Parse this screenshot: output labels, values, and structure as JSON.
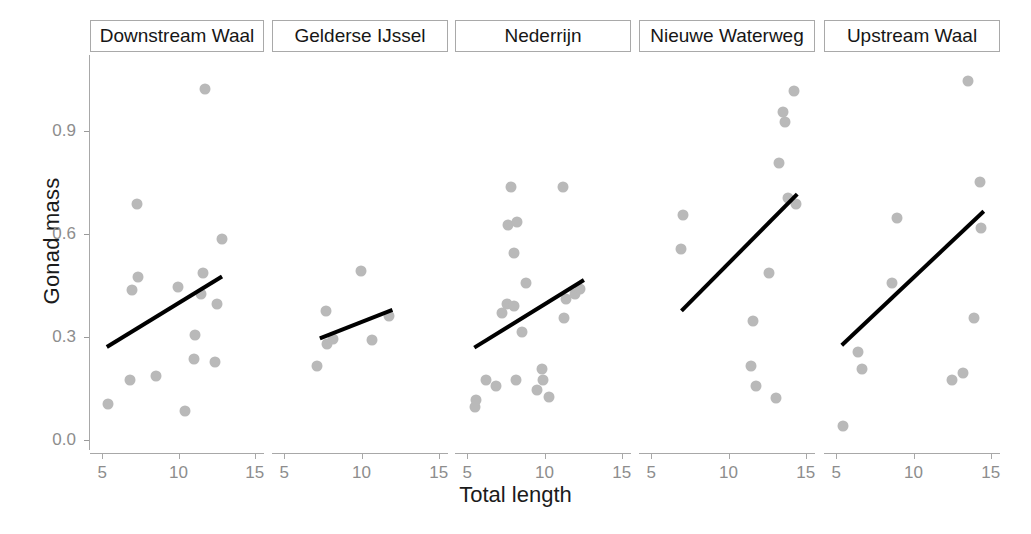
{
  "chart_data": {
    "type": "scatter",
    "title": "",
    "xlabel": "Total length",
    "ylabel": "Gonad mass",
    "xlim": [
      4.2,
      15.6
    ],
    "ylim": [
      -0.03,
      1.12
    ],
    "xticks": [
      5,
      10,
      15
    ],
    "yticks": [
      0.0,
      0.3,
      0.6,
      0.9
    ],
    "ytick_labels": [
      "0.0",
      "0.3",
      "0.6",
      "0.9"
    ],
    "xtick_labels": [
      "5",
      "10",
      "15"
    ],
    "grid": false,
    "legend": "none",
    "facet_layout": "1 row x 5 columns",
    "point_color": "#b9b9b9",
    "line_color": "#000000",
    "axis_color": "#a8a8a8",
    "tick_label_color": "#8d8d8d",
    "panels": [
      {
        "label": "Downstream Waal",
        "points": [
          {
            "x": 5.35,
            "y": 0.105
          },
          {
            "x": 6.8,
            "y": 0.175
          },
          {
            "x": 7.25,
            "y": 0.685
          },
          {
            "x": 6.95,
            "y": 0.435
          },
          {
            "x": 7.35,
            "y": 0.475
          },
          {
            "x": 8.5,
            "y": 0.185
          },
          {
            "x": 9.95,
            "y": 0.445
          },
          {
            "x": 10.4,
            "y": 0.085
          },
          {
            "x": 11.0,
            "y": 0.235
          },
          {
            "x": 11.1,
            "y": 0.305
          },
          {
            "x": 11.5,
            "y": 0.425
          },
          {
            "x": 11.6,
            "y": 0.485
          },
          {
            "x": 11.75,
            "y": 1.02
          },
          {
            "x": 12.4,
            "y": 0.225
          },
          {
            "x": 12.5,
            "y": 0.395
          },
          {
            "x": 12.85,
            "y": 0.585
          }
        ],
        "fit": {
          "x0": 5.3,
          "y0": 0.27,
          "x1": 12.85,
          "y1": 0.475
        }
      },
      {
        "label": "Gelderse IJssel",
        "points": [
          {
            "x": 7.1,
            "y": 0.215
          },
          {
            "x": 7.7,
            "y": 0.375
          },
          {
            "x": 7.75,
            "y": 0.278
          },
          {
            "x": 8.15,
            "y": 0.292
          },
          {
            "x": 9.95,
            "y": 0.49
          },
          {
            "x": 10.7,
            "y": 0.29
          },
          {
            "x": 11.75,
            "y": 0.36
          }
        ],
        "fit": {
          "x0": 7.3,
          "y0": 0.295,
          "x1": 12.0,
          "y1": 0.378
        }
      },
      {
        "label": "Nederrijn",
        "points": [
          {
            "x": 5.5,
            "y": 0.095
          },
          {
            "x": 5.55,
            "y": 0.115
          },
          {
            "x": 6.2,
            "y": 0.175
          },
          {
            "x": 6.85,
            "y": 0.155
          },
          {
            "x": 7.25,
            "y": 0.37
          },
          {
            "x": 7.6,
            "y": 0.395
          },
          {
            "x": 7.65,
            "y": 0.625
          },
          {
            "x": 7.8,
            "y": 0.735
          },
          {
            "x": 8.0,
            "y": 0.545
          },
          {
            "x": 8.05,
            "y": 0.39
          },
          {
            "x": 8.2,
            "y": 0.635
          },
          {
            "x": 8.15,
            "y": 0.175
          },
          {
            "x": 8.55,
            "y": 0.315
          },
          {
            "x": 8.8,
            "y": 0.455
          },
          {
            "x": 9.5,
            "y": 0.145
          },
          {
            "x": 9.85,
            "y": 0.205
          },
          {
            "x": 9.9,
            "y": 0.175
          },
          {
            "x": 10.3,
            "y": 0.125
          },
          {
            "x": 11.2,
            "y": 0.735
          },
          {
            "x": 11.25,
            "y": 0.355
          },
          {
            "x": 11.4,
            "y": 0.41
          },
          {
            "x": 12.0,
            "y": 0.425
          },
          {
            "x": 12.3,
            "y": 0.44
          }
        ],
        "fit": {
          "x0": 5.45,
          "y0": 0.268,
          "x1": 12.55,
          "y1": 0.465
        }
      },
      {
        "label": "Nieuwe Waterweg",
        "points": [
          {
            "x": 7.05,
            "y": 0.655
          },
          {
            "x": 6.9,
            "y": 0.555
          },
          {
            "x": 11.45,
            "y": 0.215
          },
          {
            "x": 11.8,
            "y": 0.155
          },
          {
            "x": 11.6,
            "y": 0.345
          },
          {
            "x": 12.6,
            "y": 0.485
          },
          {
            "x": 13.05,
            "y": 0.12
          },
          {
            "x": 13.25,
            "y": 0.805
          },
          {
            "x": 13.5,
            "y": 0.955
          },
          {
            "x": 13.65,
            "y": 0.925
          },
          {
            "x": 13.85,
            "y": 0.705
          },
          {
            "x": 14.25,
            "y": 1.015
          },
          {
            "x": 14.35,
            "y": 0.685
          }
        ],
        "fit": {
          "x0": 6.95,
          "y0": 0.375,
          "x1": 14.45,
          "y1": 0.715
        }
      },
      {
        "label": "Upstream Waal",
        "points": [
          {
            "x": 5.45,
            "y": 0.04
          },
          {
            "x": 6.4,
            "y": 0.255
          },
          {
            "x": 6.65,
            "y": 0.205
          },
          {
            "x": 8.6,
            "y": 0.455
          },
          {
            "x": 8.9,
            "y": 0.645
          },
          {
            "x": 12.5,
            "y": 0.175
          },
          {
            "x": 13.2,
            "y": 0.195
          },
          {
            "x": 13.55,
            "y": 1.045
          },
          {
            "x": 13.9,
            "y": 0.355
          },
          {
            "x": 14.3,
            "y": 0.75
          },
          {
            "x": 14.35,
            "y": 0.615
          }
        ],
        "fit": {
          "x0": 5.35,
          "y0": 0.275,
          "x1": 14.55,
          "y1": 0.665
        }
      }
    ]
  },
  "axes": {
    "ylabel": "Gonad mass",
    "xlabel": "Total length",
    "ytick_0": "0.0",
    "ytick_1": "0.3",
    "ytick_2": "0.6",
    "ytick_3": "0.9",
    "xtick_a": "5",
    "xtick_b": "10",
    "xtick_c": "15"
  },
  "panel_labels": {
    "p0": "Downstream Waal",
    "p1": "Gelderse IJssel",
    "p2": "Nederrijn",
    "p3": "Nieuwe Waterweg",
    "p4": "Upstream Waal"
  }
}
